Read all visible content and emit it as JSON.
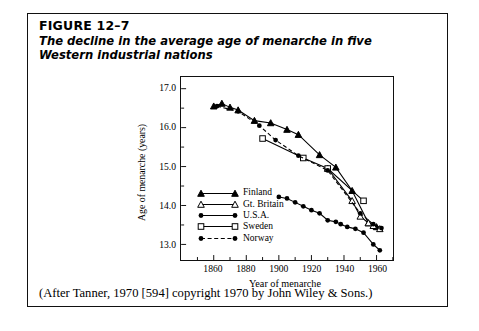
{
  "figure": {
    "number": "FIGURE 12–7",
    "caption_line1": "The decline in the average age of menarche in five",
    "caption_line2": "Western industrial nations",
    "source": "(After Tanner, 1970 [594] copyright 1970 by John Wiley & Sons.)"
  },
  "chart_data": {
    "type": "line",
    "title": "The decline in the average age of menarche in five Western industrial nations",
    "xlabel": "Year of menarche",
    "ylabel": "Age of menarche (years)",
    "xlim": [
      1840,
      1970
    ],
    "ylim": [
      12.6,
      17.3
    ],
    "xticks": [
      1860,
      1880,
      1900,
      1920,
      1940,
      1960
    ],
    "xtick_labels": [
      "1860",
      "1880",
      "1900",
      "1920",
      "1940",
      "1960"
    ],
    "yticks": [
      13.0,
      14.0,
      15.0,
      16.0,
      17.0
    ],
    "ytick_labels": [
      "13.0",
      "14.0",
      "15.0",
      "16.0",
      "17.0"
    ],
    "minor_yticks": [
      13.5,
      14.5,
      15.5,
      16.5
    ],
    "minor_xticks": [
      1850,
      1870,
      1890,
      1910,
      1930,
      1950,
      1970
    ],
    "grid": false,
    "legend_position": "lower-left-inside",
    "series": [
      {
        "name": "Finland",
        "marker": "filled-triangle",
        "line": "solid",
        "color": "#000000",
        "points": [
          [
            1860,
            16.55
          ],
          [
            1865,
            16.62
          ],
          [
            1870,
            16.52
          ],
          [
            1875,
            16.45
          ],
          [
            1885,
            16.18
          ],
          [
            1895,
            16.12
          ],
          [
            1905,
            15.95
          ],
          [
            1912,
            15.82
          ],
          [
            1925,
            15.3
          ],
          [
            1935,
            14.98
          ],
          [
            1945,
            14.38
          ],
          [
            1955,
            13.55
          ],
          [
            1960,
            13.45
          ]
        ]
      },
      {
        "name": "Gt. Britain",
        "marker": "open-triangle",
        "line": "solid",
        "color": "#000000",
        "points": [
          [
            1930,
            14.95
          ],
          [
            1945,
            14.12
          ],
          [
            1950,
            13.72
          ],
          [
            1955,
            13.55
          ],
          [
            1958,
            13.48
          ],
          [
            1962,
            13.4
          ]
        ]
      },
      {
        "name": "U.S.A.",
        "marker": "filled-circle",
        "line": "solid",
        "color": "#000000",
        "points": [
          [
            1900,
            14.22
          ],
          [
            1905,
            14.18
          ],
          [
            1910,
            14.08
          ],
          [
            1915,
            13.98
          ],
          [
            1920,
            13.88
          ],
          [
            1925,
            13.8
          ],
          [
            1930,
            13.62
          ],
          [
            1935,
            13.58
          ],
          [
            1938,
            13.52
          ],
          [
            1942,
            13.45
          ],
          [
            1947,
            13.4
          ],
          [
            1952,
            13.3
          ],
          [
            1958,
            13.0
          ],
          [
            1962,
            12.85
          ]
        ]
      },
      {
        "name": "Sweden",
        "marker": "open-square",
        "line": "solid",
        "color": "#000000",
        "points": [
          [
            1890,
            15.72
          ],
          [
            1915,
            15.22
          ],
          [
            1930,
            14.95
          ],
          [
            1952,
            14.12
          ]
        ]
      },
      {
        "name": "Norway",
        "marker": "filled-circle",
        "line": "dashed",
        "color": "#000000",
        "points": [
          [
            1862,
            16.55
          ],
          [
            1875,
            16.42
          ],
          [
            1888,
            16.05
          ],
          [
            1898,
            15.68
          ],
          [
            1912,
            15.28
          ],
          [
            1930,
            14.9
          ],
          [
            1950,
            13.8
          ],
          [
            1958,
            13.52
          ],
          [
            1963,
            13.42
          ]
        ]
      }
    ],
    "legend": [
      {
        "label": "Finland",
        "marker": "filled-triangle",
        "line": "solid"
      },
      {
        "label": "Gt. Britain",
        "marker": "open-triangle",
        "line": "solid"
      },
      {
        "label": "U.S.A.",
        "marker": "filled-circle",
        "line": "solid"
      },
      {
        "label": "Sweden",
        "marker": "open-square",
        "line": "solid"
      },
      {
        "label": "Norway",
        "marker": "filled-circle",
        "line": "dashed"
      }
    ]
  }
}
